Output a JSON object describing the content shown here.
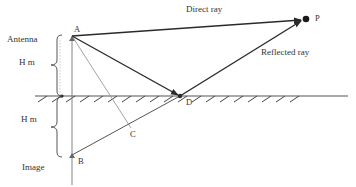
{
  "diagram": {
    "labels": {
      "direct_ray": "Direct ray",
      "reflected_ray": "Reflected ray",
      "antenna": "Antenna",
      "height_upper": "H m",
      "height_lower": "H m",
      "image": "Image"
    },
    "points": {
      "A": "A",
      "B": "B",
      "C": "C",
      "D": "D",
      "P": "P"
    },
    "colors": {
      "line": "#2a2a2a",
      "light_line": "#9a9a9a",
      "text": "#333333"
    }
  }
}
